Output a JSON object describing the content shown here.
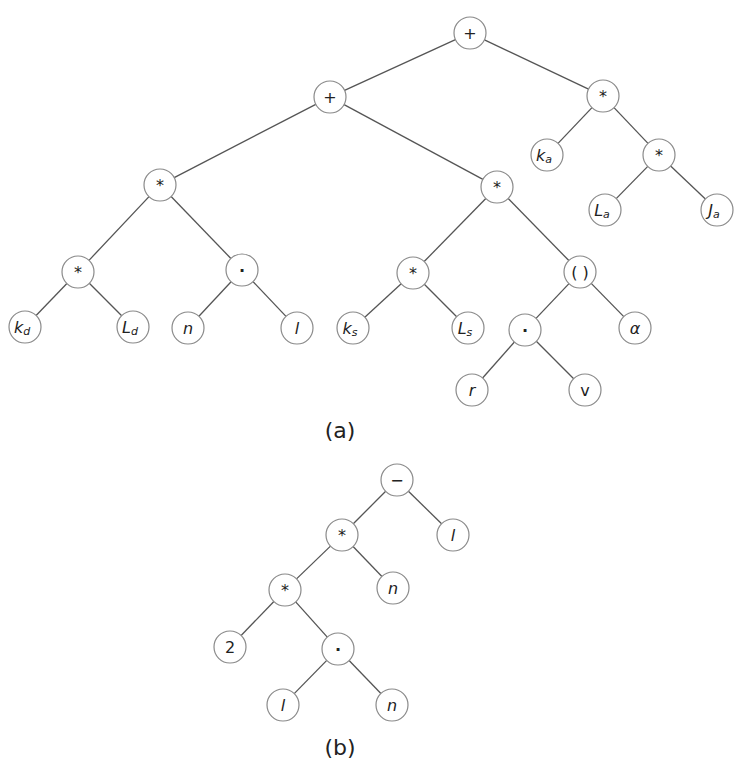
{
  "figure": {
    "captions": {
      "a": "(a)",
      "b": "(b)"
    },
    "node_radius": 16,
    "colors": {
      "edge": "#555555",
      "node_stroke": "#8a8a8a",
      "text": "#222222",
      "background": "#ffffff"
    }
  },
  "tree_a": {
    "caption": "(a)",
    "caption_pos": [
      340,
      430
    ],
    "nodes": [
      {
        "id": "a0",
        "label": "+",
        "sub": "",
        "italic": false,
        "x": 470,
        "y": 33
      },
      {
        "id": "a1",
        "label": "+",
        "sub": "",
        "italic": false,
        "x": 330,
        "y": 97
      },
      {
        "id": "a2",
        "label": "*",
        "sub": "",
        "italic": false,
        "x": 603,
        "y": 96
      },
      {
        "id": "a3",
        "label": "*",
        "sub": "",
        "italic": false,
        "x": 160,
        "y": 185
      },
      {
        "id": "a4",
        "label": "*",
        "sub": "",
        "italic": false,
        "x": 497,
        "y": 187
      },
      {
        "id": "a5",
        "label": "k",
        "sub": "a",
        "italic": true,
        "x": 547,
        "y": 155
      },
      {
        "id": "a6",
        "label": "*",
        "sub": "",
        "italic": false,
        "x": 659,
        "y": 155
      },
      {
        "id": "a7",
        "label": "L",
        "sub": "a",
        "italic": true,
        "x": 605,
        "y": 210
      },
      {
        "id": "a8",
        "label": "J",
        "sub": "a",
        "italic": true,
        "x": 717,
        "y": 210
      },
      {
        "id": "a9",
        "label": "*",
        "sub": "",
        "italic": false,
        "x": 78,
        "y": 272
      },
      {
        "id": "a10",
        "label": "·",
        "sub": "",
        "italic": false,
        "x": 242,
        "y": 270
      },
      {
        "id": "a11",
        "label": "*",
        "sub": "",
        "italic": false,
        "x": 413,
        "y": 273
      },
      {
        "id": "a12",
        "label": "( )",
        "sub": "",
        "italic": false,
        "x": 580,
        "y": 272
      },
      {
        "id": "a13",
        "label": "k",
        "sub": "d",
        "italic": true,
        "x": 25,
        "y": 327
      },
      {
        "id": "a14",
        "label": "L",
        "sub": "d",
        "italic": true,
        "x": 133,
        "y": 327
      },
      {
        "id": "a15",
        "label": "n",
        "sub": "",
        "italic": true,
        "x": 188,
        "y": 328
      },
      {
        "id": "a16",
        "label": "l",
        "sub": "",
        "italic": true,
        "x": 297,
        "y": 328
      },
      {
        "id": "a17",
        "label": "k",
        "sub": "s",
        "italic": true,
        "x": 353,
        "y": 328
      },
      {
        "id": "a18",
        "label": "L",
        "sub": "s",
        "italic": true,
        "x": 468,
        "y": 328
      },
      {
        "id": "a19",
        "label": "·",
        "sub": "",
        "italic": false,
        "x": 525,
        "y": 330
      },
      {
        "id": "a20",
        "label": "α",
        "sub": "",
        "italic": true,
        "x": 635,
        "y": 328
      },
      {
        "id": "a21",
        "label": "r",
        "sub": "",
        "italic": true,
        "x": 472,
        "y": 390
      },
      {
        "id": "a22",
        "label": "v",
        "sub": "",
        "italic": false,
        "x": 585,
        "y": 390
      }
    ],
    "edges": [
      [
        "a0",
        "a1"
      ],
      [
        "a0",
        "a2"
      ],
      [
        "a1",
        "a3"
      ],
      [
        "a1",
        "a4"
      ],
      [
        "a2",
        "a5"
      ],
      [
        "a2",
        "a6"
      ],
      [
        "a6",
        "a7"
      ],
      [
        "a6",
        "a8"
      ],
      [
        "a3",
        "a9"
      ],
      [
        "a3",
        "a10"
      ],
      [
        "a4",
        "a11"
      ],
      [
        "a4",
        "a12"
      ],
      [
        "a9",
        "a13"
      ],
      [
        "a9",
        "a14"
      ],
      [
        "a10",
        "a15"
      ],
      [
        "a10",
        "a16"
      ],
      [
        "a11",
        "a17"
      ],
      [
        "a11",
        "a18"
      ],
      [
        "a12",
        "a19"
      ],
      [
        "a12",
        "a20"
      ],
      [
        "a19",
        "a21"
      ],
      [
        "a19",
        "a22"
      ]
    ]
  },
  "tree_b": {
    "caption": "(b)",
    "caption_pos": [
      340,
      747
    ],
    "nodes": [
      {
        "id": "b0",
        "label": "−",
        "sub": "",
        "italic": false,
        "x": 397,
        "y": 480
      },
      {
        "id": "b1",
        "label": "*",
        "sub": "",
        "italic": false,
        "x": 342,
        "y": 535
      },
      {
        "id": "b2",
        "label": "l",
        "sub": "",
        "italic": true,
        "x": 453,
        "y": 535
      },
      {
        "id": "b3",
        "label": "*",
        "sub": "",
        "italic": false,
        "x": 285,
        "y": 590
      },
      {
        "id": "b4",
        "label": "n",
        "sub": "",
        "italic": true,
        "x": 393,
        "y": 588
      },
      {
        "id": "b5",
        "label": "2",
        "sub": "",
        "italic": false,
        "x": 230,
        "y": 647
      },
      {
        "id": "b6",
        "label": "·",
        "sub": "",
        "italic": false,
        "x": 338,
        "y": 649
      },
      {
        "id": "b7",
        "label": "l",
        "sub": "",
        "italic": true,
        "x": 283,
        "y": 705
      },
      {
        "id": "b8",
        "label": "n",
        "sub": "",
        "italic": true,
        "x": 392,
        "y": 705
      }
    ],
    "edges": [
      [
        "b0",
        "b1"
      ],
      [
        "b0",
        "b2"
      ],
      [
        "b1",
        "b3"
      ],
      [
        "b1",
        "b4"
      ],
      [
        "b3",
        "b5"
      ],
      [
        "b3",
        "b6"
      ],
      [
        "b6",
        "b7"
      ],
      [
        "b6",
        "b8"
      ]
    ]
  }
}
